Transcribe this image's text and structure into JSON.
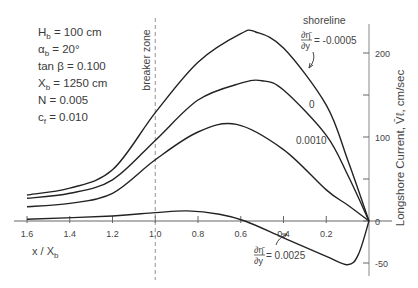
{
  "chart_data": {
    "type": "line",
    "title": "",
    "xlabel": "x / X_b",
    "ylabel": "Longshore Current, V_l, cm/sec",
    "xlim": [
      1.6,
      0
    ],
    "ylim": [
      -50,
      230
    ],
    "x_inverted": true,
    "grid": false,
    "x_ticks": [
      1.6,
      1.4,
      1.2,
      1.0,
      0.8,
      0.6,
      0.4,
      0.2
    ],
    "x_tick_labels": [
      "1.6",
      "1.4",
      "1.2",
      "1.0",
      "0.8",
      "0.6",
      "0.4",
      "0.2"
    ],
    "y_ticks": [
      -50,
      0,
      50,
      100,
      150,
      200
    ],
    "y_tick_labels": [
      "-50",
      "0",
      "",
      "100",
      "",
      "200"
    ],
    "series": [
      {
        "name": "dη/dy = -0.0005",
        "x": [
          1.6,
          1.4,
          1.2,
          1.0,
          0.8,
          0.6,
          0.53,
          0.4,
          0.2,
          0.1,
          0.0
        ],
        "values": [
          31,
          39,
          61,
          129,
          189,
          223,
          225,
          206,
          138,
          73,
          0
        ]
      },
      {
        "name": "dη/dy = 0",
        "x": [
          1.6,
          1.4,
          1.2,
          1.0,
          0.8,
          0.6,
          0.5,
          0.4,
          0.2,
          0.1,
          0.0
        ],
        "values": [
          27,
          33,
          49,
          96,
          144,
          164,
          167,
          156,
          102,
          55,
          0
        ]
      },
      {
        "name": "dη/dy = 0.0010",
        "x": [
          1.6,
          1.4,
          1.2,
          1.0,
          0.8,
          0.62,
          0.4,
          0.2,
          0.1,
          0.0
        ],
        "values": [
          17,
          21,
          33,
          73,
          106,
          115,
          85,
          37,
          19,
          0
        ]
      },
      {
        "name": "dη/dy = 0.0025",
        "x": [
          1.6,
          1.2,
          1.0,
          0.85,
          0.7,
          0.58,
          0.4,
          0.2,
          0.1,
          0.05,
          0.0
        ],
        "values": [
          2,
          6,
          10,
          12,
          8,
          0,
          -20,
          -42,
          -52,
          -40,
          0
        ]
      }
    ],
    "annotations": [
      {
        "text": "breaker zone",
        "x": 1.0,
        "style": "dashed vertical line"
      },
      {
        "text": "shoreline",
        "x": 0.0
      },
      {
        "text": "∂η̄/∂y = -0.0005",
        "target_series": 0
      },
      {
        "text": "0",
        "target_series": 1
      },
      {
        "text": "0.0010",
        "target_series": 2
      },
      {
        "text": "∂η̄/∂y = 0.0025",
        "target_series": 3
      }
    ],
    "parameters": [
      {
        "label": "H",
        "sub": "b",
        "value": "= 100 cm"
      },
      {
        "label": "α",
        "sub": "b",
        "value": "= 20°"
      },
      {
        "label": "tan β",
        "sub": "",
        "value": "= 0.100"
      },
      {
        "label": "X",
        "sub": "b",
        "value": "= 1250 cm"
      },
      {
        "label": "N",
        "sub": "",
        "value": "= 0.005"
      },
      {
        "label": "c",
        "sub": "f",
        "value": "= 0.010"
      }
    ],
    "legend": "inline labels on curves"
  },
  "labels": {
    "xlabel_main": "x / X",
    "xlabel_sub": "b",
    "ylabel": "Longshore Current, V̄ℓ, cm/sec",
    "breaker_zone": "breaker zone",
    "shoreline": "shoreline",
    "curve_top_value": "= -0.0005",
    "curve_zero": "0",
    "curve_third": "0.0010",
    "curve_bottom_value": "= 0.0025",
    "frac_num": "∂η̄",
    "frac_den": "∂y"
  }
}
